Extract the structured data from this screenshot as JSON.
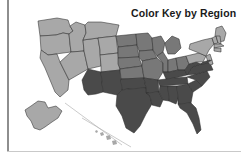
{
  "page": {
    "background_color": "#ffffff",
    "width": 241,
    "height": 157
  },
  "decorations": {
    "left_rule_color": "#8e8e8e",
    "bottom_rule_color": "#c9c9c9"
  },
  "map": {
    "title": "Color Key by Region",
    "title_color": "#1a1a1a",
    "border_color": "#2e2e2e",
    "region_colors": {
      "west": "#a8a8a8",
      "midwest": "#787878",
      "south": "#4a4a4a",
      "northeast": "#a8a8a8",
      "non_contiguous": "#a8a8a8"
    },
    "legend_regions": [
      {
        "name": "West",
        "color": "#a8a8a8"
      },
      {
        "name": "Midwest",
        "color": "#787878"
      },
      {
        "name": "South",
        "color": "#4a4a4a"
      },
      {
        "name": "Northeast",
        "color": "#a8a8a8"
      }
    ],
    "states": [
      {
        "id": "WA",
        "region": "west",
        "color": "#a8a8a8",
        "points": "38,21 57,18 68,20 70,26 73,31 69,34 63,33 56,35 40,36"
      },
      {
        "id": "OR",
        "region": "west",
        "color": "#a8a8a8",
        "points": "40,36 56,35 63,33 69,34 70,44 71,52 48,55 41,50"
      },
      {
        "id": "CA",
        "region": "west",
        "color": "#a8a8a8",
        "points": "41,50 48,55 57,54 60,62 65,72 69,80 68,90 60,97 55,92 50,80 45,68 40,58"
      },
      {
        "id": "ID",
        "region": "west",
        "color": "#a8a8a8",
        "points": "70,26 73,31 69,34 70,44 71,52 84,51 83,40 86,33 85,25 76,22"
      },
      {
        "id": "NV",
        "region": "west",
        "color": "#a8a8a8",
        "points": "71,52 84,51 88,69 69,80 65,72 60,62"
      },
      {
        "id": "UT",
        "region": "west",
        "color": "#a8a8a8",
        "points": "84,51 83,40 98,38 100,50 101,66 88,69"
      },
      {
        "id": "MT",
        "region": "midwest",
        "color": "#a8a8a8",
        "points": "85,25 86,33 83,40 98,38 116,36 119,25 101,22 88,22"
      },
      {
        "id": "WY",
        "region": "west",
        "color": "#a8a8a8",
        "points": "98,38 116,36 118,53 100,55 100,50"
      },
      {
        "id": "CO",
        "region": "west",
        "color": "#a8a8a8",
        "points": "100,55 118,53 120,70 101,72 101,66"
      },
      {
        "id": "AZ",
        "region": "south",
        "color": "#4a4a4a",
        "points": "88,69 101,72 103,92 96,94 88,95 84,90 82,80"
      },
      {
        "id": "NM",
        "region": "south",
        "color": "#4a4a4a",
        "points": "101,72 120,70 122,90 117,95 103,92"
      },
      {
        "id": "ND",
        "region": "midwest",
        "color": "#787878",
        "points": "116,36 136,34 137,45 118,47"
      },
      {
        "id": "SD",
        "region": "midwest",
        "color": "#787878",
        "points": "118,47 137,45 139,57 118,58"
      },
      {
        "id": "NE",
        "region": "midwest",
        "color": "#787878",
        "points": "118,58 139,57 142,66 120,69 118,64"
      },
      {
        "id": "KS",
        "region": "midwest",
        "color": "#787878",
        "points": "120,69 142,66 144,78 121,79"
      },
      {
        "id": "OK",
        "region": "south",
        "color": "#4a4a4a",
        "points": "121,79 144,78 146,88 128,89 122,90"
      },
      {
        "id": "TX",
        "region": "south",
        "color": "#4a4a4a",
        "points": "122,90 128,89 146,88 150,96 152,104 146,114 140,126 134,133 126,128 122,116 116,106 117,95"
      },
      {
        "id": "MN",
        "region": "midwest",
        "color": "#787878",
        "points": "136,34 148,33 152,38 153,50 139,51 137,45"
      },
      {
        "id": "IA",
        "region": "midwest",
        "color": "#787878",
        "points": "139,51 153,50 157,58 142,61 139,57"
      },
      {
        "id": "MO",
        "region": "midwest",
        "color": "#787878",
        "points": "142,61 157,58 163,63 163,72 158,80 144,78 142,66"
      },
      {
        "id": "AR",
        "region": "south",
        "color": "#4a4a4a",
        "points": "144,78 158,80 159,92 146,93 146,88"
      },
      {
        "id": "LA",
        "region": "south",
        "color": "#4a4a4a",
        "points": "146,93 159,92 163,100 160,107 152,105 150,96"
      },
      {
        "id": "WI",
        "region": "midwest",
        "color": "#787878",
        "points": "152,38 161,36 165,43 163,52 157,56 153,50"
      },
      {
        "id": "IL",
        "region": "midwest",
        "color": "#787878",
        "points": "157,56 163,52 168,60 168,72 163,72 163,63"
      },
      {
        "id": "MI",
        "region": "midwest",
        "color": "#787878",
        "points": "165,43 172,36 179,39 181,48 175,54 168,54 166,48"
      },
      {
        "id": "IN",
        "region": "midwest",
        "color": "#787878",
        "points": "168,60 176,58 178,70 169,72 168,72"
      },
      {
        "id": "OH",
        "region": "midwest",
        "color": "#787878",
        "points": "176,58 186,56 189,64 185,70 178,70"
      },
      {
        "id": "KY",
        "region": "south",
        "color": "#4a4a4a",
        "points": "163,72 169,72 178,70 185,70 187,75 175,78 166,79"
      },
      {
        "id": "TN",
        "region": "south",
        "color": "#4a4a4a",
        "points": "158,80 166,79 175,78 187,77 188,84 160,86 159,84"
      },
      {
        "id": "MS",
        "region": "south",
        "color": "#4a4a4a",
        "points": "159,92 160,86 168,86 169,101 163,100"
      },
      {
        "id": "AL",
        "region": "south",
        "color": "#4a4a4a",
        "points": "168,86 177,86 178,99 176,104 169,101"
      },
      {
        "id": "GA",
        "region": "south",
        "color": "#4a4a4a",
        "points": "177,86 188,84 193,92 191,103 178,104 178,99"
      },
      {
        "id": "FL",
        "region": "south",
        "color": "#4a4a4a",
        "points": "178,104 191,103 196,108 199,118 201,130 197,134 193,124 187,113 180,108"
      },
      {
        "id": "SC",
        "region": "south",
        "color": "#4a4a4a",
        "points": "188,84 196,80 202,86 193,92"
      },
      {
        "id": "NC",
        "region": "south",
        "color": "#4a4a4a",
        "points": "187,77 196,74 207,71 210,77 202,86 196,80"
      },
      {
        "id": "VA",
        "region": "south",
        "color": "#4a4a4a",
        "points": "187,75 192,67 201,64 210,63 213,70 207,71 196,74"
      },
      {
        "id": "WV",
        "region": "south",
        "color": "#4a4a4a",
        "points": "185,70 189,64 196,62 201,64 192,67 187,75"
      },
      {
        "id": "PA",
        "region": "northeast",
        "color": "#a8a8a8",
        "points": "186,56 199,53 206,56 203,62 196,62 189,64"
      },
      {
        "id": "NY",
        "region": "northeast",
        "color": "#a8a8a8",
        "points": "190,44 203,40 212,38 214,44 209,50 206,56 199,53 189,49"
      },
      {
        "id": "ME",
        "region": "northeast",
        "color": "#a8a8a8",
        "points": "216,28 222,26 226,33 224,41 218,42 215,36"
      },
      {
        "id": "VT",
        "region": "northeast",
        "color": "#a8a8a8",
        "points": "212,38 216,36 218,43 214,44"
      },
      {
        "id": "NH",
        "region": "northeast",
        "color": "#a8a8a8",
        "points": "216,36 220,36 221,44 218,43"
      },
      {
        "id": "MA",
        "region": "northeast",
        "color": "#a8a8a8",
        "points": "214,44 221,44 224,46 214,48"
      },
      {
        "id": "CT",
        "region": "northeast",
        "color": "#a8a8a8",
        "points": "214,48 221,48 221,52 214,51"
      },
      {
        "id": "NJ",
        "region": "northeast",
        "color": "#a8a8a8",
        "points": "206,56 210,54 212,60 208,62"
      },
      {
        "id": "MD",
        "region": "south",
        "color": "#4a4a4a",
        "points": "203,62 210,60 213,64 210,63 201,64"
      },
      {
        "id": "DE",
        "region": "northeast",
        "color": "#a8a8a8",
        "points": "208,62 212,60 213,64 210,65"
      },
      {
        "id": "AK",
        "region": "non_contiguous",
        "color": "#a8a8a8",
        "points": "31,106 38,101 45,102 48,108 56,106 62,111 58,118 52,122 45,127 40,130 34,128 31,121 27,116 25,110"
      },
      {
        "id": "HI1",
        "region": "non_contiguous",
        "color": "#a8a8a8",
        "points": "95,131 97,130 98,132 96,133"
      },
      {
        "id": "HI2",
        "region": "non_contiguous",
        "color": "#a8a8a8",
        "points": "100,133 103,132 104,135 101,136"
      },
      {
        "id": "HI3",
        "region": "non_contiguous",
        "color": "#a8a8a8",
        "points": "106,136 110,135 111,139 107,140"
      },
      {
        "id": "HI4",
        "region": "non_contiguous",
        "color": "#a8a8a8",
        "points": "112,141 116,140 117,144 113,145"
      }
    ],
    "inset_lines": [
      {
        "name": "alaska-inset-line",
        "x1": 65,
        "y1": 103,
        "x2": 122,
        "y2": 145
      },
      {
        "name": "hawaii-inset-line",
        "x1": 82,
        "y1": 118,
        "x2": 131,
        "y2": 147
      }
    ]
  }
}
